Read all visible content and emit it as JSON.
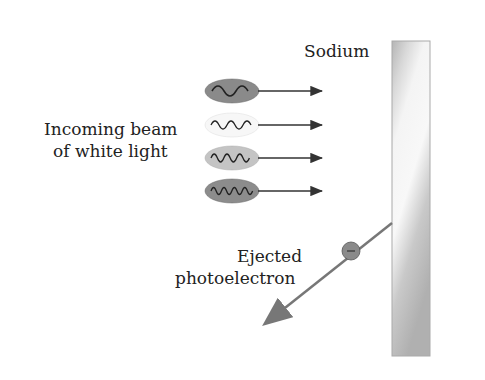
{
  "labels": {
    "metal": "Sodium",
    "beam_line1": "Incoming beam",
    "beam_line2": "of white light",
    "electron_line1": "Ejected",
    "electron_line2": "photoelectron"
  },
  "photons": [
    {
      "fill": "#8a8a8a",
      "waves": 2
    },
    {
      "fill": "#f7f7f7",
      "waves": 3
    },
    {
      "fill": "#c4c4c4",
      "waves": 4
    },
    {
      "fill": "#8c8c8c",
      "waves": 5
    }
  ],
  "electron_symbol": "−",
  "colors": {
    "arrow": "#333333",
    "electron_arrow": "#777777",
    "metal_edge": "#aaaaaa"
  }
}
